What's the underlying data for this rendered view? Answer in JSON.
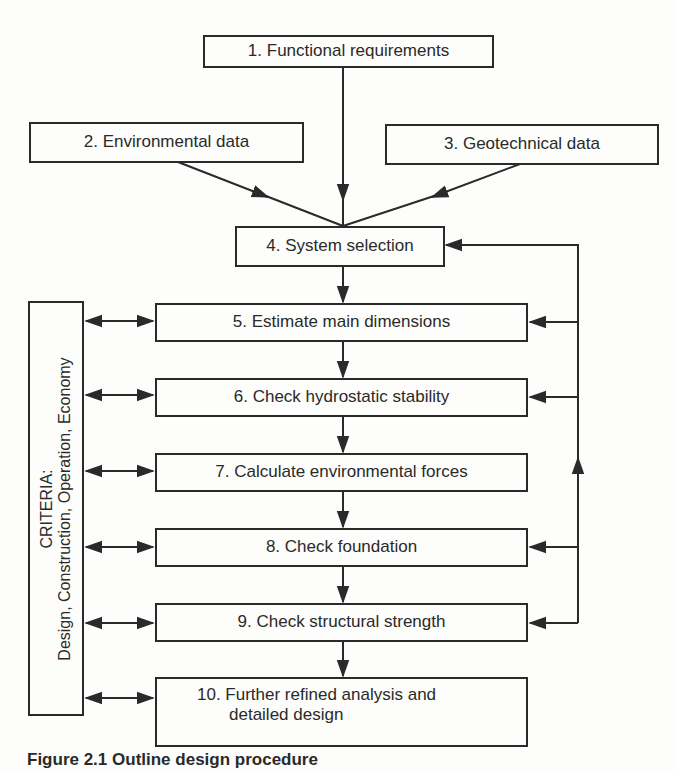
{
  "diagram": {
    "nodes": [
      {
        "id": 1,
        "label": "1. Functional requirements"
      },
      {
        "id": 2,
        "label": "2. Environmental data"
      },
      {
        "id": 3,
        "label": "3. Geotechnical data"
      },
      {
        "id": 4,
        "label": "4. System selection"
      },
      {
        "id": 5,
        "label": "5. Estimate main dimensions"
      },
      {
        "id": 6,
        "label": "6. Check hydrostatic stability"
      },
      {
        "id": 7,
        "label": "7. Calculate environmental forces"
      },
      {
        "id": 8,
        "label": "8. Check foundation"
      },
      {
        "id": 9,
        "label": "9. Check structural strength"
      },
      {
        "id": 10,
        "label_line1": "10. Further refined analysis and",
        "label_line2": "detailed design"
      }
    ],
    "criteria": {
      "title": "CRITERIA:",
      "items": "Design, Construction, Operation, Economy"
    },
    "edges": [
      {
        "from": 1,
        "to": 4
      },
      {
        "from": 2,
        "to": 4
      },
      {
        "from": 3,
        "to": 4
      },
      {
        "from": 4,
        "to": 5
      },
      {
        "from": 5,
        "to": 6
      },
      {
        "from": 6,
        "to": 7
      },
      {
        "from": 7,
        "to": 8
      },
      {
        "from": 8,
        "to": 9
      },
      {
        "from": 9,
        "to": 10
      },
      {
        "feedback": "right loop from steps 5-9 back to 4"
      },
      {
        "bidirectional": "criteria <-> steps 5-10"
      }
    ],
    "caption": "Figure 2.1  Outline design procedure"
  }
}
